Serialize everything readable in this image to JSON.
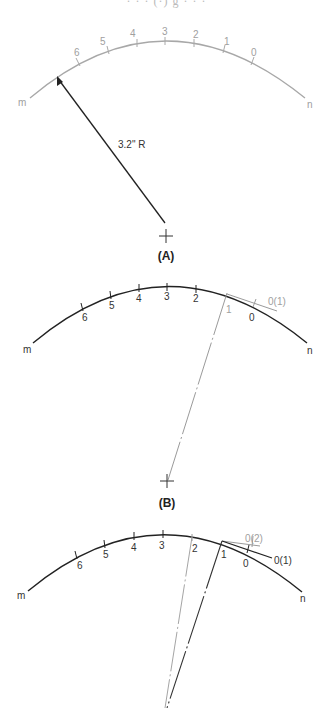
{
  "header": {
    "cropped_text": "· · · (·) g · · ·"
  },
  "panels": [
    {
      "id": "A",
      "caption": "(A)",
      "end_left": "m",
      "end_right": "n",
      "ticks": [
        "6",
        "5",
        "4",
        "3",
        "2",
        "1",
        "0"
      ],
      "radius_label": "3.2\" R",
      "arc_color": "#a8a8a8",
      "radius_color": "#222222"
    },
    {
      "id": "B",
      "caption": "(B)",
      "end_left": "m",
      "end_right": "n",
      "ticks": [
        "6",
        "5",
        "4",
        "3",
        "2",
        "1",
        "0"
      ],
      "tangent_label": "0(1)",
      "arc_color": "#222222",
      "construction_color": "#9a9a9a"
    },
    {
      "id": "C",
      "end_left": "m",
      "end_right": "n",
      "ticks": [
        "6",
        "5",
        "4",
        "3",
        "2",
        "1",
        "0"
      ],
      "tangent_labels": [
        "0(2)",
        "0(1)"
      ],
      "arc_color": "#222222",
      "construction_color": "#9a9a9a"
    }
  ]
}
